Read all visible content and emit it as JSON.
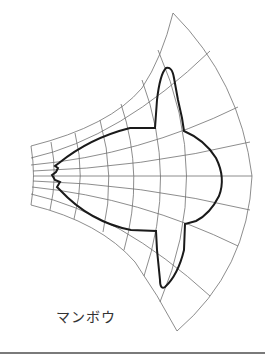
{
  "figure": {
    "caption": "マンボウ",
    "grid_color": "#707070",
    "outline_color": "#1a1a1a",
    "separator_color": "#7a7a7a"
  }
}
